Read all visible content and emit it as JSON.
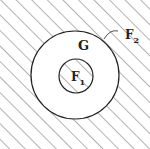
{
  "diagram": {
    "type": "set-region-diagram",
    "regions": [
      {
        "id": "F2",
        "label": "F",
        "subscript": "2",
        "description": "hatched outer region outside large circle"
      },
      {
        "id": "G",
        "label": "G",
        "subscript": "",
        "description": "unhatched annulus between circles"
      },
      {
        "id": "F1",
        "label": "F",
        "subscript": "1",
        "description": "hatched inner disk"
      }
    ],
    "colors": {
      "line": "#222222",
      "hatch": "#555555",
      "background": "#ffffff"
    }
  }
}
